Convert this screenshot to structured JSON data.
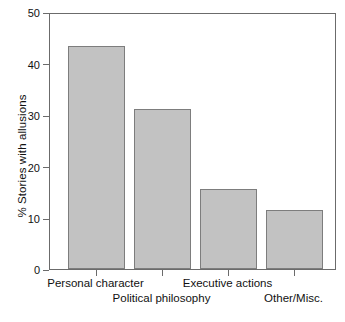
{
  "chart_data": {
    "type": "bar",
    "title": "",
    "subtitle": "",
    "xlabel": "",
    "ylabel": "% Stories with allusions",
    "categories": [
      "Personal character",
      "Political philosophy",
      "Executive actions",
      "Other/Misc."
    ],
    "values": [
      43.8,
      31.3,
      15.7,
      11.5
    ],
    "ylim": [
      0,
      50
    ],
    "yticks": [
      0,
      10,
      20,
      30,
      40,
      50
    ],
    "ytick_labels": [
      "0",
      "10",
      "20",
      "30",
      "40",
      "50"
    ],
    "grid": false,
    "legend": "none",
    "bar_color": "#c2c2c2",
    "bar_edge_color": "#7d7d7d",
    "axis_color": "#6b6b6b",
    "label_rows": [
      {
        "row": 0,
        "labels": [
          "Personal character",
          "Executive actions"
        ]
      },
      {
        "row": 1,
        "labels": [
          "Political philosophy",
          "Other/Misc."
        ]
      }
    ]
  },
  "axis": {
    "y_title": "% Stories with allusions",
    "tick_0": "0",
    "tick_10": "10",
    "tick_20": "20",
    "tick_30": "30",
    "tick_40": "40",
    "tick_50": "50"
  },
  "categories": {
    "c0": "Personal character",
    "c1": "Political philosophy",
    "c2": "Executive actions",
    "c3": "Other/Misc."
  }
}
